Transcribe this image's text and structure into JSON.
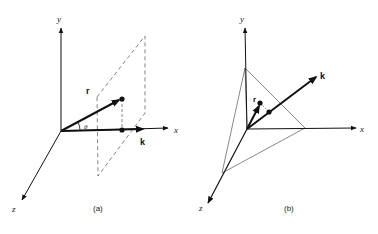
{
  "panels": [
    {
      "id": "a",
      "caption": "(a)",
      "axes": {
        "x": "x",
        "y": "y",
        "z": "z"
      },
      "vectors": {
        "r": "r",
        "k": "k"
      },
      "angle": "θ",
      "description": "Vector r at angle θ from direction k (along x-axis); dashed plane perpendicular to k with projection of r's tip onto k."
    },
    {
      "id": "b",
      "caption": "(b)",
      "axes": {
        "x": "x",
        "y": "y",
        "z": "z"
      },
      "vectors": {
        "r": "r",
        "k": "k"
      },
      "description": "Plane intersecting the x, y, z axes (triangle) with normal vector k; vector r to a point in the plane and its projection onto k."
    }
  ],
  "colors": {
    "ink": "#111111",
    "thin": "#555555",
    "dashed": "#666666",
    "background": "#ffffff"
  }
}
